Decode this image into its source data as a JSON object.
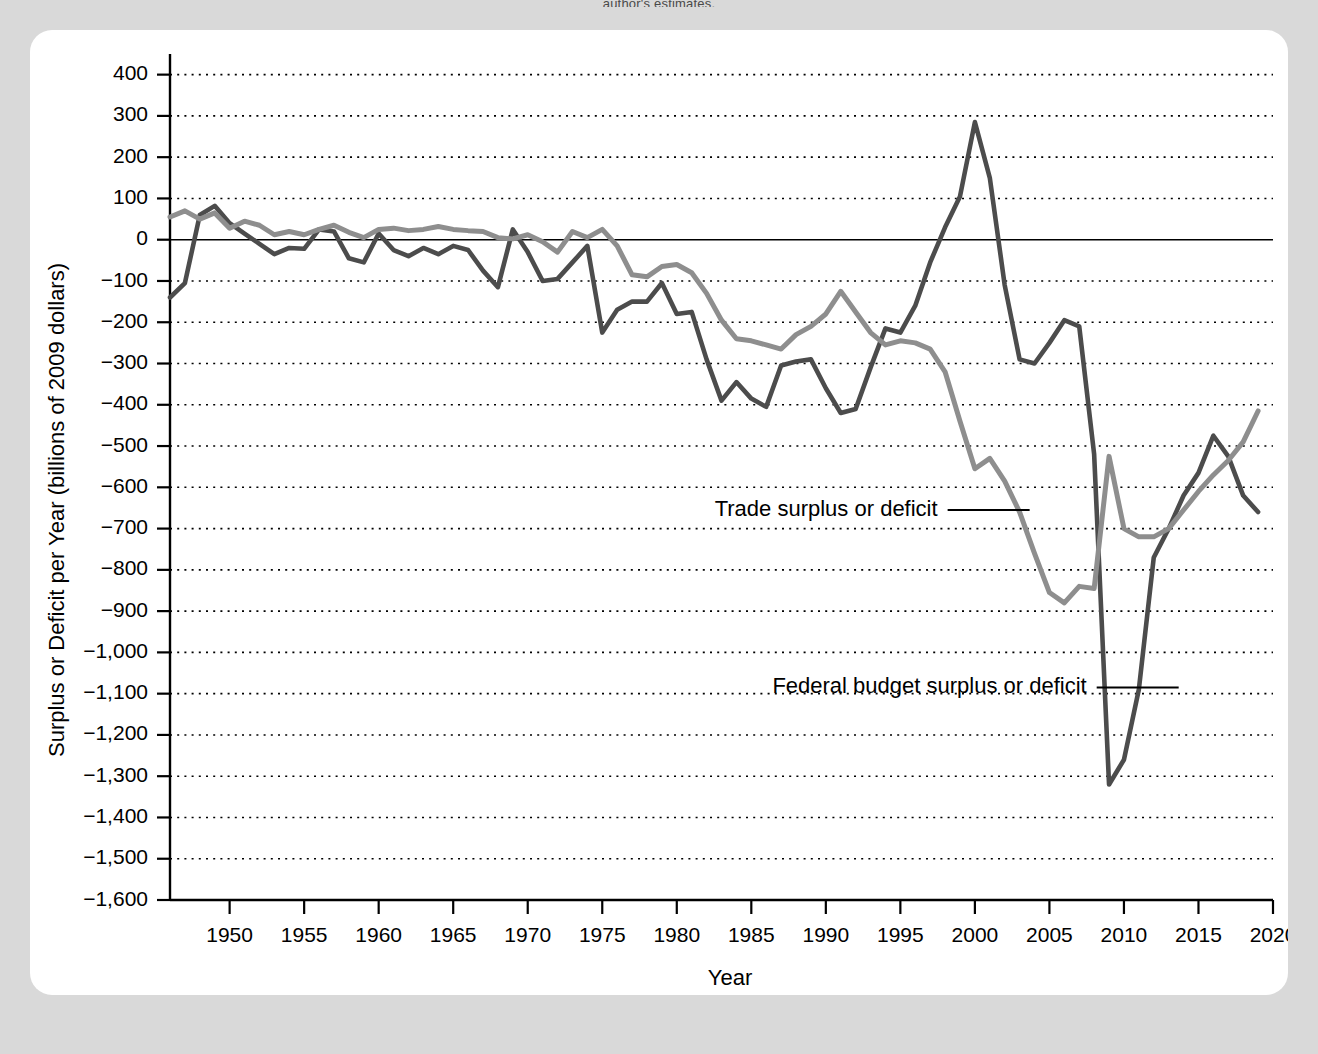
{
  "page": {
    "top_caption": "author's estimates."
  },
  "chart_data": {
    "type": "line",
    "title": "",
    "xlabel": "Year",
    "ylabel": "Surplus or Deficit per Year (billions of 2009 dollars)",
    "xlim": [
      1946,
      2020
    ],
    "ylim": [
      -1600,
      450
    ],
    "grid": true,
    "legend_position": "inline-annotations",
    "xticks": [
      1950,
      1955,
      1960,
      1965,
      1970,
      1975,
      1980,
      1985,
      1990,
      1995,
      2000,
      2005,
      2010,
      2015,
      2020
    ],
    "xticklabels": [
      "1950",
      "1955",
      "1960",
      "1965",
      "1970",
      "1975",
      "1980",
      "1985",
      "1990",
      "1995",
      "2000",
      "2005",
      "2010",
      "2015",
      "2020"
    ],
    "yticks": [
      400,
      300,
      200,
      100,
      0,
      -100,
      -200,
      -300,
      -400,
      -500,
      -600,
      -700,
      -800,
      -900,
      -1000,
      -1100,
      -1200,
      -1300,
      -1400,
      -1500,
      -1600
    ],
    "yticklabels": [
      "400",
      "300",
      "200",
      "100",
      "0",
      "−100",
      "−200",
      "−300",
      "−400",
      "−500",
      "−600",
      "−700",
      "−800",
      "−900",
      "−1,000",
      "−1,100",
      "−1,200",
      "−1,300",
      "−1,400",
      "−1,500",
      "−1,600"
    ],
    "colors": {
      "budget": "#4c4c4c",
      "trade": "#8e8e8e",
      "axis": "#000000",
      "plot_background": "#ffffff",
      "page_background": "#d9d9d9"
    },
    "annotations": [
      {
        "name": "trade-annotation",
        "text": "Trade surplus or deficit",
        "x": 1997.5,
        "y": -655
      },
      {
        "name": "budget-annotation",
        "text": "Federal budget surplus or deficit",
        "x": 2007.5,
        "y": -1085
      }
    ],
    "x": [
      1946,
      1947,
      1948,
      1949,
      1950,
      1951,
      1952,
      1953,
      1954,
      1955,
      1956,
      1957,
      1958,
      1959,
      1960,
      1961,
      1962,
      1963,
      1964,
      1965,
      1966,
      1967,
      1968,
      1969,
      1970,
      1971,
      1972,
      1973,
      1974,
      1975,
      1976,
      1977,
      1978,
      1979,
      1980,
      1981,
      1982,
      1983,
      1984,
      1985,
      1986,
      1987,
      1988,
      1989,
      1990,
      1991,
      1992,
      1993,
      1994,
      1995,
      1996,
      1997,
      1998,
      1999,
      2000,
      2001,
      2002,
      2003,
      2004,
      2005,
      2006,
      2007,
      2008,
      2009,
      2010,
      2011,
      2012,
      2013,
      2014,
      2015,
      2016,
      2017,
      2018,
      2019
    ],
    "series": [
      {
        "name": "Federal budget surplus or deficit",
        "key": "budget",
        "color": "#4c4c4c",
        "values": [
          -140,
          -105,
          60,
          82,
          40,
          15,
          -10,
          -35,
          -20,
          -22,
          25,
          20,
          -45,
          -55,
          15,
          -25,
          -40,
          -20,
          -35,
          -15,
          -25,
          -75,
          -115,
          25,
          -30,
          -100,
          -95,
          -55,
          -15,
          -225,
          -170,
          -150,
          -150,
          -105,
          -180,
          -175,
          -290,
          -390,
          -345,
          -385,
          -405,
          -305,
          -295,
          -290,
          -360,
          -420,
          -410,
          -310,
          -215,
          -225,
          -160,
          -55,
          30,
          105,
          285,
          150,
          -110,
          -290,
          -300,
          -250,
          -195,
          -210,
          -520,
          -1320,
          -1260,
          -1090,
          -770,
          -700,
          -620,
          -565,
          -475,
          -525,
          -620,
          -660
        ]
      },
      {
        "name": "Trade surplus or deficit",
        "key": "trade",
        "color": "#8e8e8e",
        "values": [
          55,
          70,
          50,
          65,
          28,
          45,
          35,
          12,
          20,
          12,
          25,
          35,
          18,
          5,
          25,
          28,
          22,
          25,
          32,
          25,
          22,
          20,
          5,
          2,
          12,
          -5,
          -30,
          20,
          5,
          25,
          -15,
          -85,
          -90,
          -65,
          -60,
          -80,
          -130,
          -195,
          -240,
          -245,
          -255,
          -265,
          -230,
          -210,
          -180,
          -125,
          -175,
          -225,
          -255,
          -245,
          -250,
          -265,
          -320,
          -440,
          -555,
          -530,
          -585,
          -660,
          -760,
          -855,
          -880,
          -840,
          -845,
          -525,
          -700,
          -720,
          -720,
          -700,
          -655,
          -610,
          -570,
          -535,
          -490,
          -415
        ]
      }
    ]
  }
}
